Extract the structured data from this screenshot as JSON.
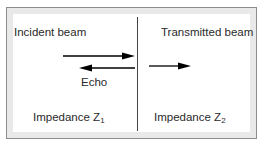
{
  "diagram": {
    "left_region": {
      "title": "Incident beam",
      "echo_label": "Echo",
      "impedance_label": "Impedance Z",
      "impedance_subscript": "1"
    },
    "right_region": {
      "title": "Transmitted beam",
      "impedance_label": "Impedance Z",
      "impedance_subscript": "2"
    },
    "arrows": [
      {
        "name": "incident",
        "direction": "right"
      },
      {
        "name": "echo",
        "direction": "left"
      },
      {
        "name": "transmitted",
        "direction": "right"
      }
    ],
    "colors": {
      "border": "#8c8c8c",
      "band": "#e9e9e9",
      "line": "#000000"
    }
  }
}
